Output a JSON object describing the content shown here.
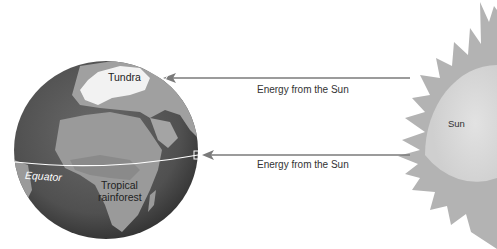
{
  "diagram": {
    "labels": {
      "tundra": "Tundra",
      "equator": "Equator",
      "tropical_rainforest_line1": "Tropical",
      "tropical_rainforest_line2": "rainforest",
      "sun": "Sun",
      "energy_upper": "Energy from the Sun",
      "energy_lower": "Energy from the Sun"
    },
    "colors": {
      "background": "#ffffff",
      "ocean": "#5a5a5a",
      "land": "#9a9a9a",
      "land_light": "#b5b5b5",
      "ice": "#ffffff",
      "sun_rays": "#b3b3b3",
      "sun_core": "#d8d8d8",
      "arrow": "#7a7a7a",
      "text": "#333333"
    }
  }
}
